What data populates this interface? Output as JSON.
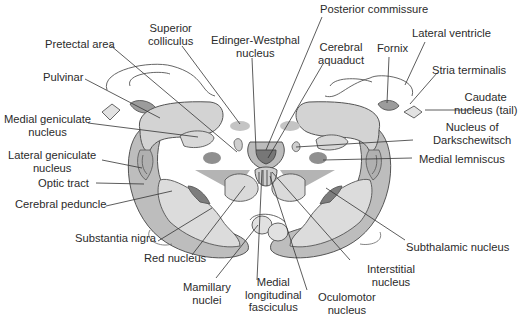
{
  "figure": {
    "type": "anatomical cross-section",
    "colors": {
      "light_gray": "#d8d8d8",
      "medium_gray": "#bdbdbd",
      "dark_gray": "#8a8a8a",
      "outline": "#555555",
      "leader_line": "#333333",
      "text": "#2b2b2b"
    }
  },
  "labels": {
    "posterior_commissure": "Posterior commissure",
    "superior_colliculus": "Superior\ncolliculus",
    "edinger_westphal": "Edinger-Westphal\nnucleus",
    "cerebral_aquaduct": "Cerebral\naquaduct",
    "fornix": "Fornix",
    "lateral_ventricle": "Lateral ventricle",
    "pretectal_area": "Pretectal area",
    "stria_terminalis": "Stria terminalis",
    "pulvinar": "Pulvinar",
    "caudate_nucleus_tail": "Caudate\nnucleus (tail)",
    "medial_geniculate": "Medial geniculate\nnucleus",
    "nucleus_darkschewitsch": "Nucleus of\nDarkschewitsch",
    "lateral_geniculate": "Lateral geniculate\nnucleus",
    "medial_lemniscus": "Medial lemniscus",
    "optic_tract": "Optic tract",
    "cerebral_peduncle": "Cerebral peduncle",
    "substantia_nigra": "Substantia nigra",
    "subthalamic_nucleus": "Subthalamic nucleus",
    "red_nucleus": "Red nucleus",
    "interstitial_nucleus": "Interstitial\nnucleus",
    "mamillary_nuclei": "Mamillary\nnuclei",
    "medial_longitudinal_fasciculus": "Medial\nlongitudinal\nfasciculus",
    "oculomotor_nucleus": "Oculomotor\nnucleus"
  }
}
